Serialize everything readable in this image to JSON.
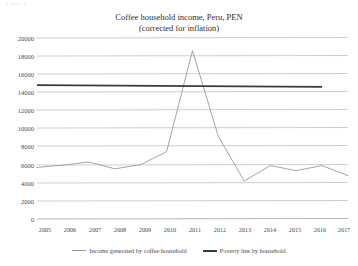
{
  "figure": {
    "cut_header_text": "Figure 3",
    "title_line1": "Coffee household income, Peru, PEN",
    "title_line2": "(corrected for inflation)"
  },
  "legend": {
    "income_label": "Income generated by coffee household",
    "poverty_label": "Poverty line by household",
    "income_color": "#9a9a9a",
    "poverty_color": "#3a3a3a"
  },
  "chart_data": {
    "type": "line",
    "title": "Coffee household income, Peru, PEN (corrected for inflation)",
    "xlabel": "",
    "ylabel": "",
    "grid": true,
    "legend_position": "bottom",
    "x": [
      2005,
      2006,
      2007,
      2008,
      2009,
      2010,
      2011,
      2012,
      2013,
      2014,
      2015,
      2016,
      2017
    ],
    "xtick_labels": [
      "2005",
      "2006",
      "2007",
      "2008",
      "2009",
      "2010",
      "2011",
      "2012",
      "2013",
      "2014",
      "2015",
      "2016",
      "2017"
    ],
    "ytick_labels": [
      "0",
      "2000",
      "4000",
      "6000",
      "8000",
      "10000",
      "12000",
      "14000",
      "16000",
      "18000",
      "20000"
    ],
    "yticks": [
      0,
      2000,
      4000,
      6000,
      8000,
      10000,
      12000,
      14000,
      16000,
      18000,
      20000
    ],
    "ylim": [
      0,
      20000
    ],
    "xlim": [
      2005,
      2017
    ],
    "series": [
      {
        "name": "Income generated by coffee household",
        "color": "#9a9a9a",
        "values": [
          5700,
          5950,
          6300,
          5550,
          6000,
          7450,
          18600,
          9100,
          4200,
          5900,
          5350,
          5900,
          4800
        ]
      },
      {
        "name": "Poverty line by household",
        "color": "#3a3a3a",
        "x": [
          2005,
          2016
        ],
        "values": [
          14800,
          14600
        ]
      }
    ]
  }
}
